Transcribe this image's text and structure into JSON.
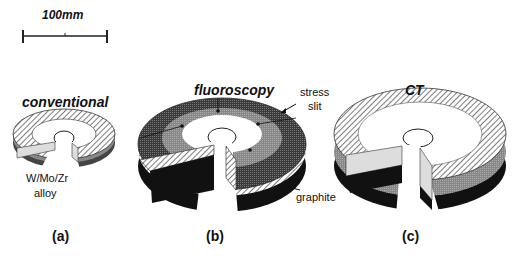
{
  "scale_bar": {
    "label": "100mm"
  },
  "panels": [
    {
      "id": "a",
      "title": "conventional",
      "caption": "(a)",
      "annotation": "W/Mo/Zr\nalloy",
      "annotation_line1": "W/Mo/Zr",
      "annotation_line2": "alloy"
    },
    {
      "id": "b",
      "title": "fluoroscopy",
      "caption": "(b)",
      "annotations": {
        "stress_slit_line1": "stress",
        "stress_slit_line2": "slit",
        "graphite": "graphite"
      }
    },
    {
      "id": "c",
      "title": "CT",
      "caption": "(c)"
    }
  ],
  "colors": {
    "hatch": "#555555",
    "dark": "#2a2a2a",
    "mid": "#7a7a7a",
    "light": "#d8d8d8",
    "black": "#0a0a0a"
  }
}
